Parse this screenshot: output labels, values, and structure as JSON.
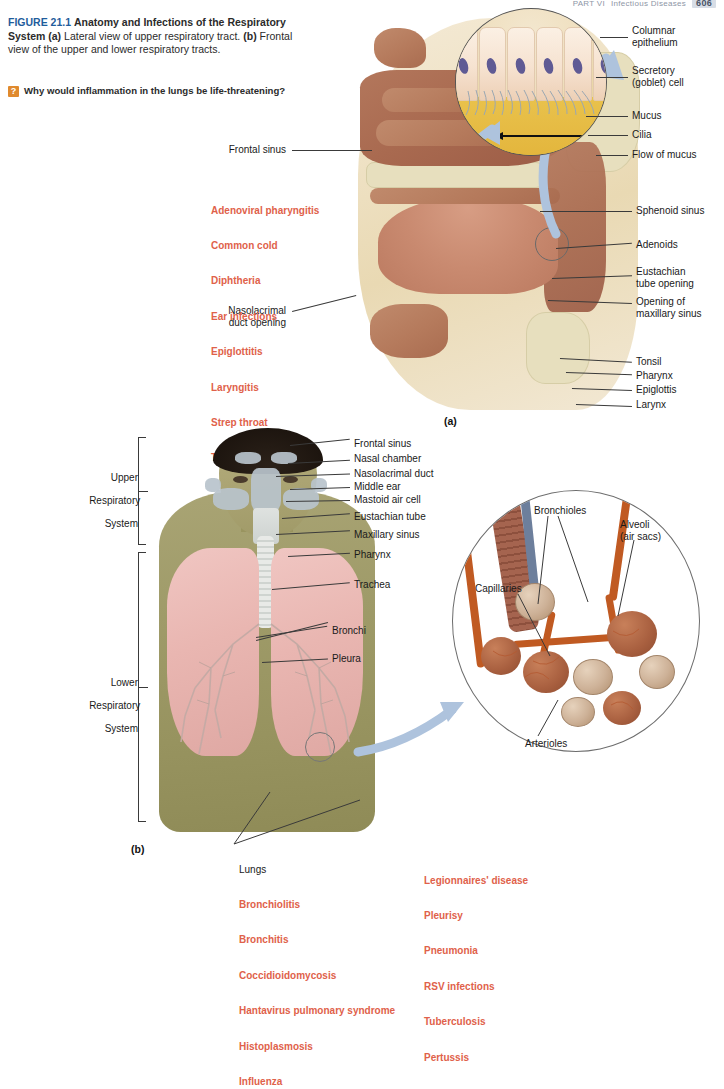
{
  "runhead": {
    "part": "PART VI",
    "section": "Infectious Diseases",
    "page": "606"
  },
  "caption": {
    "figure_number": "FIGURE 21.1",
    "title": "Anatomy and Infections of the Respiratory System",
    "panel_a_label": "(a)",
    "panel_a_text": "Lateral view of upper respiratory tract.",
    "panel_b_label": "(b)",
    "panel_b_text": "Frontal view of the upper and lower respiratory tracts.",
    "question_badge": "?",
    "question": "Why would inflammation in the lungs be life-threatening?"
  },
  "panels": {
    "a": "(a)",
    "b": "(b)"
  },
  "cilia_inset": {
    "labels": [
      "Columnar\nepithelium",
      "Secretory\n(goblet) cell",
      "Mucus",
      "Cilia",
      "Flow of mucus"
    ]
  },
  "panel_a": {
    "left_labels": [
      "Frontal sinus",
      "Nasolacrimal\nduct opening"
    ],
    "right_labels": [
      "Sphenoid sinus",
      "Adenoids",
      "Eustachian\ntube opening",
      "Opening of\nmaxillary sinus",
      "Tonsil",
      "Pharynx",
      "Epiglottis",
      "Larynx"
    ]
  },
  "panel_b": {
    "brackets": [
      {
        "line1": "Upper",
        "line2": "Respiratory",
        "line3": "System"
      },
      {
        "line1": "Lower",
        "line2": "Respiratory",
        "line3": "System"
      }
    ],
    "labels": [
      "Frontal sinus",
      "Nasal chamber",
      "Nasolacrimal duct",
      "Middle ear",
      "Mastoid air cell",
      "Eustachian tube",
      "Maxillary sinus",
      "Pharynx",
      "Trachea",
      "Bronchi",
      "Pleura"
    ]
  },
  "alveoli_inset": {
    "labels": [
      "Bronchioles",
      "Alveoli\n(air sacs)",
      "Capillaries",
      "Arterioles"
    ]
  },
  "disease_lists": {
    "upper": [
      "Adenoviral pharyngitis",
      "Common cold",
      "Diphtheria",
      "Ear infections",
      "Epiglottitis",
      "Laryngitis",
      "Strep throat",
      "Tonsillitis"
    ],
    "lungs_heading": "Lungs",
    "lower_col1": [
      "Bronchiolitis",
      "Bronchitis",
      "Coccidioidomycosis",
      "Hantavirus pulmonary syndrome",
      "Histoplasmosis",
      "Influenza"
    ],
    "lower_col2": [
      "Legionnaires' disease",
      "Pleurisy",
      "Pneumonia",
      "RSV infections",
      "Tuberculosis",
      "Pertussis"
    ]
  },
  "colors": {
    "figure_blue": "#1f5d9c",
    "disease_red": "#e0614a",
    "badge_orange": "#e08a2e",
    "mucus_yellow": "#e9c24c",
    "lung_pink": "#e9b6b1",
    "vessel_orange": "#c05a22"
  }
}
